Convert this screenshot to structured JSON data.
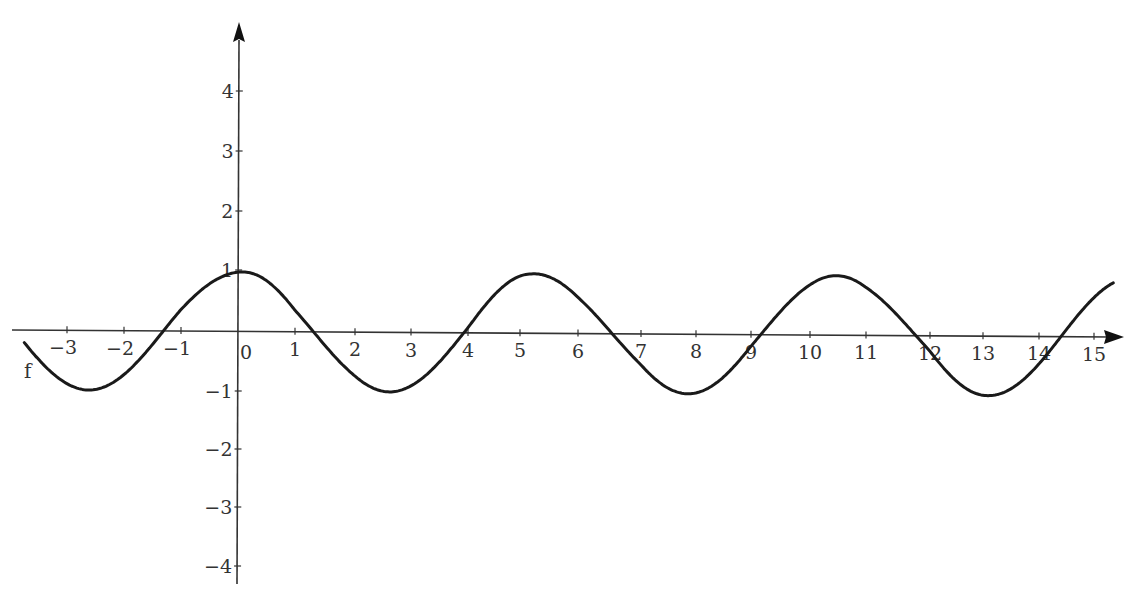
{
  "chart_data": {
    "type": "line",
    "title": "",
    "xlabel": "",
    "ylabel": "",
    "xlim": [
      -3.8,
      15.4
    ],
    "ylim": [
      -4.3,
      5.2
    ],
    "grid": false,
    "legend": null,
    "function_label": "f",
    "x_ticks": [
      -3,
      -2,
      -1,
      0,
      1,
      2,
      3,
      4,
      5,
      6,
      7,
      8,
      9,
      10,
      11,
      12,
      13,
      14,
      15
    ],
    "x_tick_labels": [
      "−3",
      "−2",
      "−1",
      "0",
      "1",
      "2",
      "3",
      "4",
      "5",
      "6",
      "7",
      "8",
      "9",
      "10",
      "11",
      "12",
      "13",
      "14",
      "15"
    ],
    "y_ticks": [
      -4,
      -3,
      -2,
      -1,
      1,
      2,
      3,
      4
    ],
    "y_tick_labels": [
      "−4",
      "−3",
      "−2",
      "−1",
      "1",
      "2",
      "3",
      "4"
    ],
    "series": [
      {
        "name": "f",
        "expression": "cos(1.2x)",
        "x_range": [
          -3.75,
          15.35
        ],
        "key_points": [
          {
            "x": -2.62,
            "y": -1,
            "kind": "minimum"
          },
          {
            "x": -1.31,
            "y": 0,
            "kind": "zero"
          },
          {
            "x": 0,
            "y": 1,
            "kind": "maximum"
          },
          {
            "x": 1.31,
            "y": 0,
            "kind": "zero"
          },
          {
            "x": 2.62,
            "y": -1,
            "kind": "minimum"
          },
          {
            "x": 3.93,
            "y": 0,
            "kind": "zero"
          },
          {
            "x": 5.24,
            "y": 1,
            "kind": "maximum"
          },
          {
            "x": 6.54,
            "y": 0,
            "kind": "zero"
          },
          {
            "x": 7.85,
            "y": -1,
            "kind": "minimum"
          },
          {
            "x": 9.16,
            "y": 0,
            "kind": "zero"
          },
          {
            "x": 10.47,
            "y": 1,
            "kind": "maximum"
          },
          {
            "x": 11.78,
            "y": 0,
            "kind": "zero"
          },
          {
            "x": 13.09,
            "y": -1,
            "kind": "minimum"
          },
          {
            "x": 14.4,
            "y": 0,
            "kind": "zero"
          }
        ]
      }
    ]
  },
  "style": {
    "curve_color": "#1a1a1a",
    "axis_color": "#333333",
    "background": "#ffffff"
  }
}
